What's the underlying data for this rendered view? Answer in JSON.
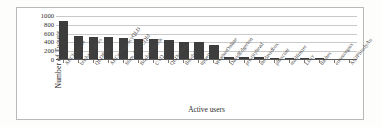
{
  "chart_data": {
    "type": "bar",
    "title": "",
    "xlabel": "Active users",
    "ylabel": "Number of Tweets",
    "ylim": [
      0,
      1000
    ],
    "yticks": [
      1000,
      800,
      600,
      400,
      200,
      0
    ],
    "grid": true,
    "legend": "none",
    "bar_color": "#3d3d3d",
    "categories": [
      "ABCbrisbane",
      "brisbane_news",
      "QLDPolice",
      "ABCemergencyQLD",
      "Stam_News_Qld",
      "Brisbanefloods",
      "CYQ_AU",
      "QLDonline",
      "floods2011",
      "tippetts",
      "WeatherOnline",
      "DavidEdgerton",
      "priorityhead",
      "thedavidbox",
      "phoscunt",
      "mailfinster",
      "Lissy",
      "flashes",
      "eriomorgms",
      "AUJPStudyAu"
    ],
    "values": [
      880,
      545,
      525,
      515,
      500,
      480,
      470,
      465,
      400,
      400,
      330,
      75,
      65,
      60,
      55,
      55,
      40,
      35,
      30,
      28
    ]
  },
  "figure": {
    "frame_color": "#b9b9b9",
    "axis_color": "#5a5a5a",
    "grid_color": "#c9c9c9",
    "background": "#ffffff"
  }
}
